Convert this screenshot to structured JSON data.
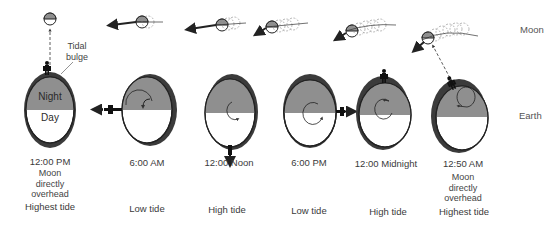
{
  "row_labels": {
    "moon": "Moon",
    "earth": "Earth"
  },
  "annotations": {
    "tidal_bulge_line1": "Tidal",
    "tidal_bulge_line2": "bulge",
    "night": "Night",
    "day": "Day"
  },
  "colors": {
    "night_fill": "#8f8f8f",
    "bulge_fill": "#3b3b3b",
    "outline": "#222222",
    "day_fill": "#ffffff"
  },
  "panels": [
    {
      "time": "12:00 PM",
      "description": [
        "Moon",
        "directly",
        "overhead"
      ],
      "tide": "Highest tide"
    },
    {
      "time": "6:00 AM",
      "description": [],
      "tide": "Low tide"
    },
    {
      "time": "12:00  Noon",
      "description": [],
      "tide": "High  tide"
    },
    {
      "time": "6:00 PM",
      "description": [],
      "tide": "Low  tide"
    },
    {
      "time": "12:00  Midnight",
      "description": [],
      "tide": "High  tide"
    },
    {
      "time": "12:50 AM",
      "description": [
        "Moon",
        "directly",
        "overhead"
      ],
      "tide": "Highest  tide"
    }
  ]
}
